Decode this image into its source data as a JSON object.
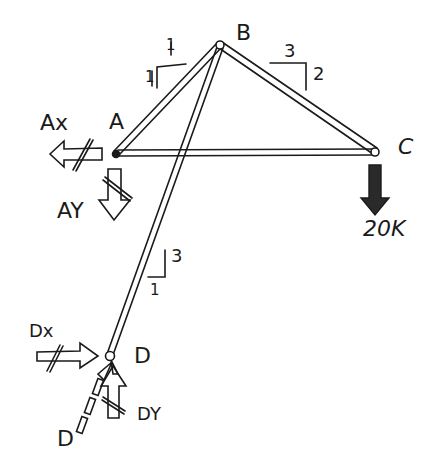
{
  "diagram": {
    "type": "truss free body diagram",
    "colors": {
      "ink": "#1a1a1a",
      "background": "#ffffff",
      "load_fill": "#2a2a2a"
    },
    "nodes": {
      "A": {
        "label": "A",
        "x": 116,
        "y": 154
      },
      "B": {
        "label": "B",
        "x": 220,
        "y": 45
      },
      "C": {
        "label": "C",
        "x": 375,
        "y": 152
      },
      "D": {
        "label": "D",
        "x": 110,
        "y": 356
      }
    },
    "members": [
      "A-B",
      "B-C",
      "A-C",
      "B-D"
    ],
    "slopes": {
      "AB": {
        "rise": "1",
        "run": "1"
      },
      "BC": {
        "run": "3",
        "rise": "2"
      },
      "BD": {
        "rise": "3",
        "run": "1"
      }
    },
    "loads": {
      "C": {
        "label": "20K",
        "direction": "down"
      }
    },
    "reactions": {
      "Ax": {
        "label": "Ax",
        "direction": "left"
      },
      "Ay": {
        "label": "AY",
        "direction": "down"
      },
      "Dx": {
        "label": "Dx",
        "direction": "right"
      },
      "Dy": {
        "label": "DY",
        "direction": "up"
      },
      "D": {
        "label": "D",
        "direction": "along member BD"
      }
    }
  }
}
